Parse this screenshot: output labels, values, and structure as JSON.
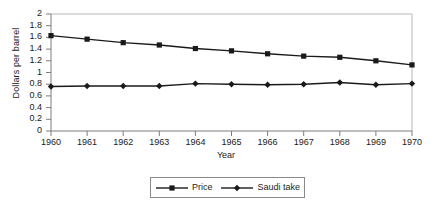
{
  "chart_data": {
    "type": "line",
    "title": "",
    "xlabel": "Year",
    "ylabel": "Dollars per barrel",
    "x": [
      1960,
      1961,
      1962,
      1963,
      1964,
      1965,
      1966,
      1967,
      1968,
      1969,
      1970
    ],
    "xtick_labels": [
      "1960",
      "1961",
      "1962",
      "1963",
      "1964",
      "1965",
      "1966",
      "1967",
      "1968",
      "1969",
      "1970"
    ],
    "ytick_labels": [
      "0",
      "0.2",
      "0.4",
      "0.6",
      "0.8",
      "1",
      "1.2",
      "1.4",
      "1.6",
      "1.8",
      "2"
    ],
    "ytick_values": [
      0,
      0.2,
      0.4,
      0.6,
      0.8,
      1,
      1.2,
      1.4,
      1.6,
      1.8,
      2
    ],
    "ylim": [
      0,
      2
    ],
    "xlim": [
      1960,
      1970
    ],
    "grid": false,
    "legend_position": "bottom",
    "series": [
      {
        "name": "Price",
        "marker": "square",
        "color": "#1a1a1a",
        "values": [
          1.63,
          1.57,
          1.51,
          1.47,
          1.41,
          1.37,
          1.32,
          1.28,
          1.26,
          1.2,
          1.13
        ]
      },
      {
        "name": "Saudi take",
        "marker": "diamond",
        "color": "#1a1a1a",
        "values": [
          0.76,
          0.77,
          0.77,
          0.77,
          0.81,
          0.8,
          0.79,
          0.8,
          0.83,
          0.79,
          0.81
        ]
      }
    ]
  },
  "legend": {
    "entries": [
      {
        "label": "Price"
      },
      {
        "label": "Saudi take"
      }
    ]
  },
  "axes": {
    "y_axis_title": "Dollars per barrel",
    "x_axis_title": "Year"
  }
}
